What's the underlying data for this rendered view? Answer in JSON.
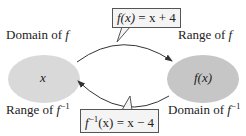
{
  "diagram": {
    "top_formula": {
      "lhs": "f(x)",
      "rhs": "= x + 4"
    },
    "bottom_formula": {
      "lhs_base": "f",
      "lhs_sup": "−1",
      "lhs_arg": "(x)",
      "rhs": "= x − 4"
    },
    "left_set": {
      "label_top": "Domain of ",
      "label_top_var": "f",
      "label_bottom": "Range of ",
      "label_bottom_var": "f",
      "label_bottom_sup": "−1",
      "content": "x",
      "fill": "#d9d9d9"
    },
    "right_set": {
      "label_top": "Range of ",
      "label_top_var": "f",
      "label_bottom": "Domain of ",
      "label_bottom_var": "f",
      "label_bottom_sup": "−1",
      "content": "f(x)",
      "fill": "#c6c6c6"
    }
  }
}
